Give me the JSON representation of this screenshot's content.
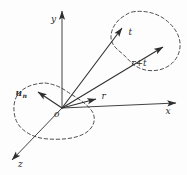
{
  "figure": {
    "type": "vector-diagram",
    "background": "#fdfdfd",
    "line_color": "#2e2e2e",
    "labels": {
      "y_axis": "y",
      "x_axis": "x",
      "z_axis": "z",
      "origin": "o",
      "r_vector": "r",
      "t_vector": "t",
      "r_plus_t_vector": "r+t",
      "normal_vector_base": "u",
      "normal_vector_sub": "n"
    }
  }
}
